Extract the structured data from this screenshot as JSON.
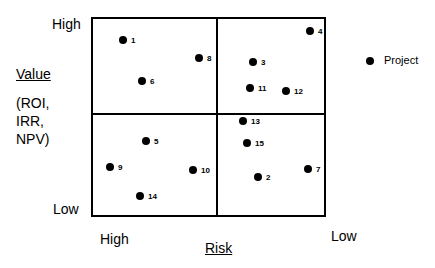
{
  "chart_data": {
    "type": "scatter",
    "title": "",
    "xlabel": "Risk",
    "ylabel": "Value (ROI, IRR, NPV)",
    "x_axis": {
      "left_label": "High",
      "right_label": "Low"
    },
    "y_axis": {
      "top_label": "High",
      "bottom_label": "Low"
    },
    "quadrants": "2x2 grid",
    "legend": [
      {
        "marker": "filled-circle",
        "label": "Project"
      }
    ],
    "points": [
      {
        "id": "1",
        "x": 123,
        "y": 40
      },
      {
        "id": "2",
        "x": 258,
        "y": 177
      },
      {
        "id": "3",
        "x": 253,
        "y": 62
      },
      {
        "id": "4",
        "x": 310,
        "y": 31
      },
      {
        "id": "5",
        "x": 146,
        "y": 141
      },
      {
        "id": "6",
        "x": 142,
        "y": 81
      },
      {
        "id": "7",
        "x": 308,
        "y": 169
      },
      {
        "id": "8",
        "x": 199,
        "y": 58
      },
      {
        "id": "9",
        "x": 110,
        "y": 167
      },
      {
        "id": "10",
        "x": 193,
        "y": 170
      },
      {
        "id": "11",
        "x": 250,
        "y": 88
      },
      {
        "id": "12",
        "x": 286,
        "y": 91
      },
      {
        "id": "13",
        "x": 243,
        "y": 121
      },
      {
        "id": "14",
        "x": 140,
        "y": 196
      },
      {
        "id": "15",
        "x": 247,
        "y": 143
      }
    ]
  },
  "labels": {
    "y_high": "High",
    "y_low": "Low",
    "y_title": "Value",
    "y_sub1": "(ROI,",
    "y_sub2": "IRR,",
    "y_sub3": "NPV)",
    "x_high": "High",
    "x_low": "Low",
    "x_title": "Risk",
    "legend_label": "Project"
  }
}
